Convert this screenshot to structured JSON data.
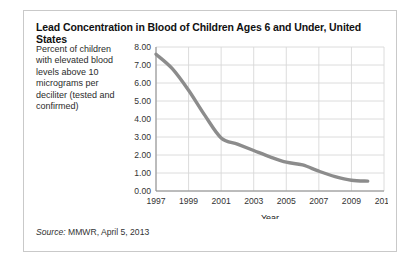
{
  "figure": {
    "title": "Lead Concentration in Blood of Children Ages 6 and Under, United States",
    "y_axis_caption": "Percent of children with elevated blood levels above 10 micrograms per deciliter (tested and confirmed)",
    "source_prefix": "Source:",
    "source_text": "MMWR, April 5, 2013",
    "border_color": "#c9c9c9",
    "line_color": "#8c8c8c",
    "grid_color": "#d8d8d8",
    "axis_color": "#8a8a8a"
  },
  "chart_data": {
    "type": "line",
    "title": "Lead Concentration in Blood of Children Ages 6 and Under, United States",
    "xlabel": "Year",
    "ylabel": "Percent of children with elevated blood levels above 10 micrograms per deciliter (tested and confirmed)",
    "xlim": [
      1997,
      2011
    ],
    "ylim": [
      0,
      8
    ],
    "xticks": [
      1997,
      1999,
      2001,
      2003,
      2005,
      2007,
      2009,
      2011
    ],
    "xticklabels": [
      "1997",
      "1999",
      "2001",
      "2003",
      "2005",
      "2007",
      "2009",
      "2011"
    ],
    "yticks": [
      0,
      1,
      2,
      3,
      4,
      5,
      6,
      7,
      8
    ],
    "yticklabels": [
      "0.00",
      "1.00",
      "2.00",
      "3.00",
      "4.00",
      "5.00",
      "6.00",
      "7.00",
      "8.00"
    ],
    "grid": true,
    "legend": "none",
    "x": [
      1997,
      1998,
      1999,
      2000,
      2001,
      2002,
      2003,
      2004,
      2005,
      2006,
      2007,
      2008,
      2009,
      2010
    ],
    "values": [
      7.6,
      6.8,
      5.6,
      4.2,
      2.95,
      2.6,
      2.25,
      1.9,
      1.6,
      1.45,
      1.1,
      0.8,
      0.6,
      0.55
    ],
    "series": [
      {
        "name": "Percent of children with elevated blood lead levels",
        "values": [
          7.6,
          6.8,
          5.6,
          4.2,
          2.95,
          2.6,
          2.25,
          1.9,
          1.6,
          1.45,
          1.1,
          0.8,
          0.6,
          0.55
        ]
      }
    ]
  }
}
